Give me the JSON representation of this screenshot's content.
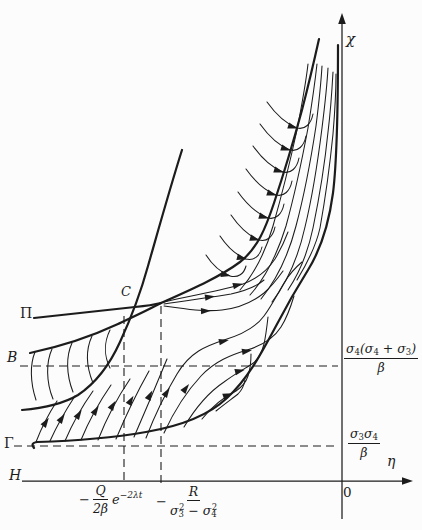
{
  "colors": {
    "ink": "#1c1c1c",
    "paper": "#fcfcfc"
  },
  "axes": {
    "chi": "χ",
    "eta": "η",
    "origin": "0"
  },
  "point_labels": {
    "pi": "Π",
    "b": "B",
    "c": "C",
    "gamma": "Γ",
    "h": "H"
  },
  "right_labels": {
    "upper": {
      "p1": "σ",
      "s1": "4",
      "p2": "(σ",
      "s2": "4",
      "p3": " + σ",
      "s3": "3",
      "p4": ")",
      "den": "β"
    },
    "lower": {
      "p1": "σ",
      "s1": "3",
      "p2": "σ",
      "s2": "4",
      "den": "β"
    }
  },
  "bottom_labels": {
    "first": {
      "sign": "−",
      "num": "Q",
      "den": "2β",
      "exp_base": "e",
      "exp": "−2λt"
    },
    "second": {
      "sign": "−",
      "num": "R",
      "d1": "σ",
      "d1sub": "3",
      "d1sup": "2",
      "d2": " − σ",
      "d2sub": "4",
      "d2sup": "2"
    }
  }
}
